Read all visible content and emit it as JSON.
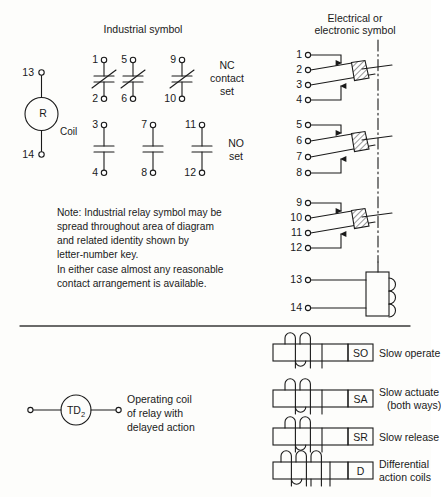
{
  "figure": {
    "headings": {
      "industrial": "Industrial symbol",
      "electrical_line1": "Electrical or",
      "electrical_line2": "electronic symbol"
    },
    "industrial": {
      "coil": {
        "marker": "R",
        "label": "Coil",
        "terminal_top": "13",
        "terminal_bottom": "14"
      },
      "nc_label_line1": "NC",
      "nc_label_line2": "contact",
      "nc_label_line3": "set",
      "no_label_line1": "NO",
      "no_label_line2": "set",
      "nc_contacts": [
        {
          "top": "1",
          "bottom": "2"
        },
        {
          "top": "5",
          "bottom": "6"
        },
        {
          "top": "9",
          "bottom": "10"
        }
      ],
      "no_contacts": [
        {
          "top": "3",
          "bottom": "4"
        },
        {
          "top": "7",
          "bottom": "8"
        },
        {
          "top": "11",
          "bottom": "12"
        }
      ]
    },
    "electrical": {
      "contact_groups": [
        {
          "terminals": [
            "1",
            "2",
            "3",
            "4"
          ]
        },
        {
          "terminals": [
            "5",
            "6",
            "7",
            "8"
          ]
        },
        {
          "terminals": [
            "9",
            "10",
            "11",
            "12"
          ]
        }
      ],
      "coil": {
        "terminal_top": "13",
        "terminal_bottom": "14"
      }
    },
    "note": {
      "line1": "Note: Industrial relay symbol may be",
      "line2": "spread throughout area of diagram",
      "line3": "and related identity shown by",
      "line4": "letter-number key.",
      "line5": "In either case almost any reasonable",
      "line6": "contact arrangement is available."
    },
    "delay": {
      "marker_text": "TD",
      "marker_sub": "2",
      "desc_line1": "Operating coil",
      "desc_line2": "of relay with",
      "desc_line3": "delayed action"
    },
    "coil_types": [
      {
        "tag": "SO",
        "desc_line1": "Slow operate",
        "desc_line2": "",
        "loops": 2,
        "taps": 0
      },
      {
        "tag": "SA",
        "desc_line1": "Slow actuate",
        "desc_line2": "(both ways)",
        "loops": 2,
        "taps": 0
      },
      {
        "tag": "SR",
        "desc_line1": "Slow release",
        "desc_line2": "",
        "loops": 2,
        "taps": 0
      },
      {
        "tag": "D",
        "desc_line1": "Differential",
        "desc_line2": "action coils",
        "loops": 3,
        "taps": 3
      }
    ],
    "colors": {
      "ink": "#1a1a1a",
      "paper": "#fdfdfb",
      "rule": "#3a3a3a"
    }
  }
}
